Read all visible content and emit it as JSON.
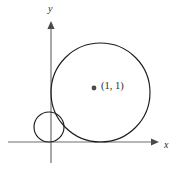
{
  "figure": {
    "kind": "geometry-diagram",
    "background_color": "#ffffff",
    "axes": {
      "x_axis": {
        "label": "x",
        "stroke_color": "#6f6f6f",
        "start_px": [
          8,
          142
        ],
        "end_px": [
          158,
          142
        ],
        "arrow": "right-arrow-head"
      },
      "y_axis": {
        "label": "y",
        "stroke_color": "#6f6f6f",
        "start_px": [
          51,
          163
        ],
        "end_px": [
          51,
          22
        ],
        "arrow": "up-arrow-head"
      },
      "origin_px": [
        51,
        142
      ]
    },
    "shapes": [
      {
        "name": "large-circle",
        "center_px": [
          100,
          92
        ],
        "radius_px": 49.5,
        "stroke_color": "#1c1c1c",
        "center_label": "(1, 1)",
        "center_marker": "filled-dot"
      },
      {
        "name": "small-circle",
        "center_px": [
          49,
          127
        ],
        "radius_px": 15,
        "stroke_color": "#1c1c1c"
      }
    ],
    "labels": {
      "center_point": "(1, 1)",
      "x_axis": "x",
      "y_axis": "y"
    }
  }
}
